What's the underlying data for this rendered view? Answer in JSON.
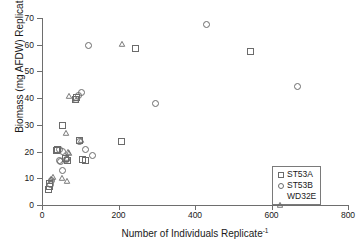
{
  "chart_data": {
    "type": "scatter",
    "title": "",
    "xlabel": "Number of Individuals Replicate-1",
    "ylabel": "Biomass (mg AFDW) Replicate-1",
    "xlabel_base": "Number of Individuals Replicate",
    "xlabel_sup": "-1",
    "ylabel_base": "Biomass (mg AFDW) Replicate",
    "ylabel_sup": "-1",
    "xlim": [
      0,
      800
    ],
    "ylim": [
      0,
      70
    ],
    "xticks": [
      0,
      200,
      400,
      600,
      800
    ],
    "yticks": [
      0,
      10,
      20,
      30,
      40,
      50,
      60,
      70
    ],
    "grid": false,
    "legend_position": "bottom-right",
    "series": [
      {
        "name": "ST53A",
        "marker": "square",
        "color": "#6b6b6b",
        "points": [
          [
            14,
            6.2
          ],
          [
            18,
            7.4
          ],
          [
            16,
            8.6
          ],
          [
            38,
            21.3
          ],
          [
            34,
            20.6
          ],
          [
            52,
            30.1
          ],
          [
            60,
            17.8
          ],
          [
            64,
            17.2
          ],
          [
            88,
            40.8
          ],
          [
            84,
            40.0
          ],
          [
            96,
            24.5
          ],
          [
            104,
            17.3
          ],
          [
            110,
            17.0
          ],
          [
            205,
            24.3
          ],
          [
            243,
            58.9
          ],
          [
            542,
            57.7
          ]
        ]
      },
      {
        "name": "ST53B",
        "marker": "circle",
        "color": "#6b6b6b",
        "points": [
          [
            20,
            8.0
          ],
          [
            22,
            9.4
          ],
          [
            42,
            21.0
          ],
          [
            50,
            20.4
          ],
          [
            44,
            17.0
          ],
          [
            46,
            16.6
          ],
          [
            50,
            13.3
          ],
          [
            62,
            17.5
          ],
          [
            92,
            41.2
          ],
          [
            100,
            42.3
          ],
          [
            118,
            60.1
          ],
          [
            112,
            21.1
          ],
          [
            130,
            18.9
          ],
          [
            96,
            24.0
          ],
          [
            293,
            38.4
          ],
          [
            428,
            68.0
          ],
          [
            666,
            44.6
          ]
        ]
      },
      {
        "name": "WD32E",
        "marker": "triangle",
        "color": "#6b6b6b",
        "points": [
          [
            16,
            9.8
          ],
          [
            20,
            10.6
          ],
          [
            44,
            10.2
          ],
          [
            58,
            8.9
          ],
          [
            56,
            26.9
          ],
          [
            60,
            20.0
          ],
          [
            64,
            19.3
          ],
          [
            58,
            17.6
          ],
          [
            64,
            40.8
          ],
          [
            82,
            39.4
          ],
          [
            94,
            24.2
          ],
          [
            200,
            60.4
          ]
        ]
      }
    ]
  },
  "legend": {
    "items": [
      {
        "label": "ST53A",
        "marker": "square"
      },
      {
        "label": "ST53B",
        "marker": "circle"
      },
      {
        "label": "WD32E",
        "marker": "triangle"
      }
    ]
  }
}
